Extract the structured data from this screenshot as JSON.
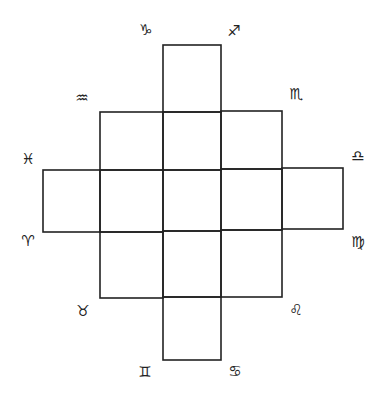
{
  "diagram": {
    "title": "",
    "line_color": "#222222",
    "background": "#ffffff",
    "symbols": {
      "capricorn": "♑",
      "sagittarius": "♐",
      "aquarius": "♒",
      "scorpio": "♏",
      "pisces": "♓",
      "libra": "♎",
      "aries": "♈",
      "virgo": "♍",
      "taurus": "♉",
      "leo": "♌",
      "gemini": "♊",
      "cancer": "♋"
    }
  }
}
